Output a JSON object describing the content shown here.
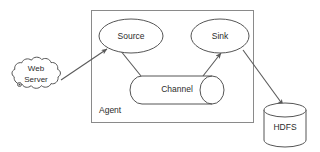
{
  "diagram": {
    "background_color": "#ffffff",
    "stroke_color": "#555555",
    "container_stroke_color": "#8a8a8a",
    "text_color": "#2b2b2b",
    "container": {
      "label": "Agent",
      "shape": "rectangle"
    },
    "nodes": [
      {
        "id": "web-server",
        "label_line1": "Web",
        "label_line2": "Server",
        "shape": "cloud"
      },
      {
        "id": "source",
        "label": "Source",
        "shape": "ellipse"
      },
      {
        "id": "channel",
        "label": "Channel",
        "shape": "cylinder-horizontal"
      },
      {
        "id": "sink",
        "label": "Sink",
        "shape": "ellipse"
      },
      {
        "id": "hdfs",
        "label": "HDFS",
        "shape": "cylinder-vertical"
      }
    ],
    "edges": [
      {
        "id": "web-server-to-source",
        "from": "web-server",
        "to": "source",
        "arrow": "to"
      },
      {
        "id": "source-to-channel",
        "from": "source",
        "to": "channel",
        "arrow": "none"
      },
      {
        "id": "channel-to-sink",
        "from": "channel",
        "to": "sink",
        "arrow": "to"
      },
      {
        "id": "sink-to-hdfs",
        "from": "sink",
        "to": "hdfs",
        "arrow": "to"
      }
    ]
  }
}
